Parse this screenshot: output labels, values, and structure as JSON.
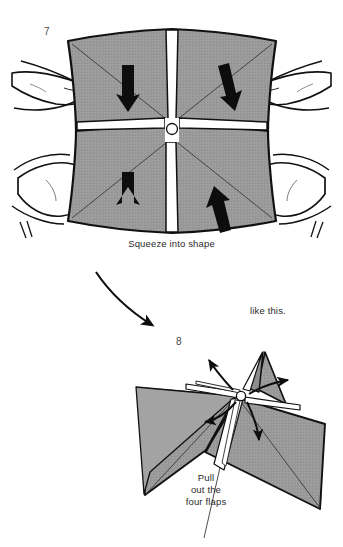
{
  "document": {
    "type": "origami-instruction-diagram",
    "title": "Origami folding steps 7 and 8",
    "background_color": "#ffffff"
  },
  "palette": {
    "paper_gray": "#9a9a9a",
    "paper_gray_shaded": "#8d8d8d",
    "paper_white": "#ffffff",
    "ink_black": "#0d0d0d",
    "outline": "#111111",
    "caption_text": "#2b2b2b",
    "step_number_text": "#4a4a4a"
  },
  "steps": [
    {
      "id": "step-7",
      "number": "7",
      "caption": "Squeeze into shape",
      "description": "Two hands squeeze a square sheet with a white cross crease pattern; four black arrows point inward toward the centre.",
      "arrow_count": 4,
      "arrow_directions": [
        "down",
        "down",
        "up",
        "up"
      ],
      "hand_count": 2,
      "finger_count": 4
    },
    {
      "id": "step-8",
      "number": "8",
      "caption": "Pull\nout the\nfour flaps",
      "caption_lines": [
        "Pull",
        "out the",
        "four flaps"
      ],
      "annotation": "like this.",
      "description": "Resulting three dimensional form with four curved arrows radiating outward from the apex indicating the four flaps to pull out.",
      "arrow_count": 4,
      "arrow_directions": [
        "up-left",
        "up-right",
        "left",
        "down"
      ]
    }
  ],
  "transition": {
    "id": "step-transition-arrow",
    "label": "",
    "shape": "curved-arrow",
    "from_step": "7",
    "to_step": "8"
  }
}
